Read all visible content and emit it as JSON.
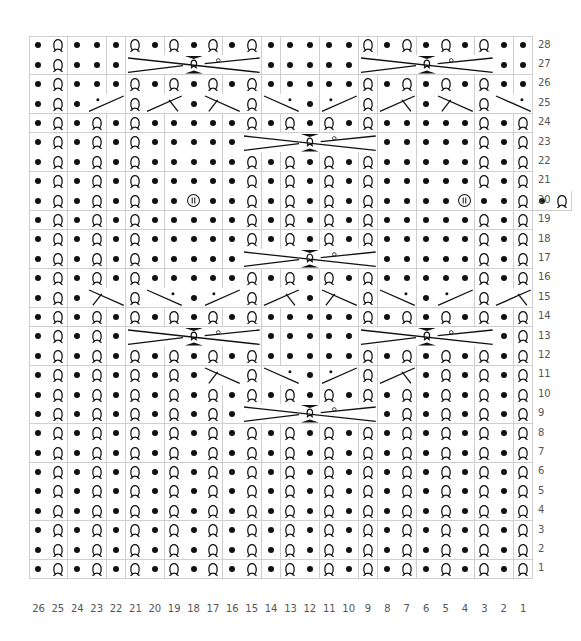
{
  "chart_data": {
    "type": "table",
    "title": "",
    "columns": 26,
    "rows": 28,
    "legend": {
      "P": "purl (dot)",
      "Q": "knit through back loop (twisted loop)",
      "B": "bobble / (II) symbol",
      "C7": "7-stitch cable cross",
      "XU": "2-stitch cross, rising right, with dot",
      "XUB": "2-stitch cross, rising right, with branch",
      "XD": "2-stitch cross, falling right, with dot",
      "XDB": "2-stitch cross, falling right, with branch"
    },
    "row_data": {
      "28": [
        "P",
        "Q",
        "P",
        "P",
        "P",
        "Q",
        "P",
        "Q",
        "P",
        "Q",
        "P",
        "Q",
        "P",
        "P",
        "P",
        "P",
        "P",
        "Q",
        "P",
        "Q",
        "P",
        "Q",
        "P",
        "Q",
        "P",
        "P"
      ],
      "27": [
        "P",
        "Q",
        "P",
        "P",
        "P",
        "C7:21-15",
        "P",
        "P",
        "P",
        "P",
        "P",
        "C7:9-3",
        "P",
        "P"
      ],
      "26": [
        "P",
        "Q",
        "P",
        "P",
        "P",
        "Q",
        "P",
        "Q",
        "P",
        "Q",
        "P",
        "Q",
        "P",
        "P",
        "P",
        "P",
        "P",
        "Q",
        "P",
        "Q",
        "P",
        "Q",
        "P",
        "Q",
        "P",
        "P"
      ],
      "25": [
        "P",
        "Q",
        "P",
        "XU",
        "Q",
        "XUB",
        "P",
        "XDB",
        "Q",
        "XD",
        "P",
        "XU",
        "Q",
        "XUB",
        "P",
        "XDB",
        "Q",
        "XD"
      ],
      "24": [
        "P",
        "Q",
        "P",
        "Q",
        "P",
        "Q",
        "P",
        "P",
        "P",
        "P",
        "P",
        "Q",
        "P",
        "Q",
        "P",
        "Q",
        "P",
        "Q",
        "P",
        "P",
        "P",
        "P",
        "P",
        "Q",
        "P",
        "Q"
      ],
      "23": [
        "P",
        "Q",
        "P",
        "Q",
        "P",
        "Q",
        "P",
        "P",
        "P",
        "P",
        "P",
        "C7:15-9",
        "P",
        "P",
        "P",
        "P",
        "P",
        "Q",
        "P",
        "Q"
      ],
      "22": [
        "P",
        "Q",
        "P",
        "Q",
        "P",
        "Q",
        "P",
        "P",
        "P",
        "P",
        "P",
        "Q",
        "P",
        "Q",
        "P",
        "Q",
        "P",
        "Q",
        "P",
        "P",
        "P",
        "P",
        "P",
        "Q",
        "P",
        "Q"
      ],
      "21": [
        "P",
        "Q",
        "P",
        "Q",
        "P",
        "Q",
        "P",
        "P",
        "P",
        "P",
        "P",
        "Q",
        "P",
        "Q",
        "P",
        "Q",
        "P",
        "Q",
        "P",
        "P",
        "P",
        "P",
        "P",
        "Q",
        "P",
        "Q"
      ],
      "20": [
        "P",
        "Q",
        "P",
        "Q",
        "P",
        "Q",
        "P",
        "P",
        "B",
        "P",
        "P",
        "Q",
        "P",
        "Q",
        "P",
        "Q",
        "P",
        "Q",
        "P",
        "P",
        "P",
        "P",
        "B",
        "P",
        "P",
        "Q",
        "P",
        "Q"
      ],
      "19": [
        "P",
        "Q",
        "P",
        "Q",
        "P",
        "Q",
        "P",
        "P",
        "P",
        "P",
        "P",
        "Q",
        "P",
        "Q",
        "P",
        "Q",
        "P",
        "Q",
        "P",
        "P",
        "P",
        "P",
        "P",
        "Q",
        "P",
        "Q"
      ],
      "18": [
        "P",
        "Q",
        "P",
        "Q",
        "P",
        "Q",
        "P",
        "P",
        "P",
        "P",
        "P",
        "Q",
        "P",
        "Q",
        "P",
        "Q",
        "P",
        "Q",
        "P",
        "P",
        "P",
        "P",
        "P",
        "Q",
        "P",
        "Q"
      ],
      "17": [
        "P",
        "Q",
        "P",
        "Q",
        "P",
        "Q",
        "P",
        "P",
        "P",
        "P",
        "P",
        "C7:15-9",
        "P",
        "P",
        "P",
        "P",
        "P",
        "Q",
        "P",
        "Q"
      ],
      "16": [
        "P",
        "Q",
        "P",
        "Q",
        "P",
        "Q",
        "P",
        "P",
        "P",
        "P",
        "P",
        "Q",
        "P",
        "Q",
        "P",
        "Q",
        "P",
        "Q",
        "P",
        "P",
        "P",
        "P",
        "P",
        "Q",
        "P",
        "Q"
      ],
      "15": [
        "P",
        "Q",
        "P",
        "XDB",
        "Q",
        "XD",
        "P",
        "XU",
        "Q",
        "XUB",
        "P",
        "XDB",
        "Q",
        "XD",
        "P",
        "XU",
        "Q",
        "XUB"
      ],
      "14": [
        "P",
        "Q",
        "P",
        "Q",
        "P",
        "Q",
        "P",
        "Q",
        "P",
        "Q",
        "P",
        "Q",
        "P",
        "P",
        "P",
        "P",
        "P",
        "Q",
        "P",
        "Q",
        "P",
        "Q",
        "P",
        "Q",
        "P",
        "Q"
      ],
      "13": [
        "P",
        "Q",
        "P",
        "Q",
        "P",
        "C7:21-15",
        "P",
        "P",
        "P",
        "P",
        "P",
        "C7:9-3",
        "P",
        "Q"
      ],
      "12": [
        "P",
        "Q",
        "P",
        "Q",
        "P",
        "Q",
        "P",
        "Q",
        "P",
        "Q",
        "P",
        "Q",
        "P",
        "P",
        "P",
        "P",
        "P",
        "Q",
        "P",
        "Q",
        "P",
        "Q",
        "P",
        "Q",
        "P",
        "Q"
      ],
      "11": [
        "P",
        "Q",
        "P",
        "Q",
        "P",
        "Q",
        "P",
        "Q",
        "P",
        "XDB",
        "Q",
        "XD",
        "P",
        "XU",
        "Q",
        "XUB",
        "P",
        "Q",
        "P",
        "Q",
        "P",
        "Q"
      ],
      "10": [
        "P",
        "Q",
        "P",
        "Q",
        "P",
        "Q",
        "P",
        "Q",
        "P",
        "Q",
        "P",
        "Q",
        "P",
        "Q",
        "P",
        "Q",
        "P",
        "Q",
        "P",
        "Q",
        "P",
        "Q",
        "P",
        "Q",
        "P",
        "Q"
      ],
      "9": [
        "P",
        "Q",
        "P",
        "Q",
        "P",
        "Q",
        "P",
        "Q",
        "P",
        "Q",
        "P",
        "C7:15-9",
        "P",
        "Q",
        "P",
        "Q",
        "P",
        "Q",
        "P",
        "Q"
      ],
      "8": [
        "P",
        "Q",
        "P",
        "Q",
        "P",
        "Q",
        "P",
        "Q",
        "P",
        "Q",
        "P",
        "Q",
        "P",
        "Q",
        "P",
        "Q",
        "P",
        "Q",
        "P",
        "Q",
        "P",
        "Q",
        "P",
        "Q",
        "P",
        "Q"
      ],
      "7": [
        "P",
        "Q",
        "P",
        "Q",
        "P",
        "Q",
        "P",
        "Q",
        "P",
        "Q",
        "P",
        "Q",
        "P",
        "Q",
        "P",
        "Q",
        "P",
        "Q",
        "P",
        "Q",
        "P",
        "Q",
        "P",
        "Q",
        "P",
        "Q"
      ],
      "6": [
        "P",
        "Q",
        "P",
        "Q",
        "P",
        "Q",
        "P",
        "Q",
        "P",
        "Q",
        "P",
        "Q",
        "P",
        "Q",
        "P",
        "Q",
        "P",
        "Q",
        "P",
        "Q",
        "P",
        "Q",
        "P",
        "Q",
        "P",
        "Q"
      ],
      "5": [
        "P",
        "Q",
        "P",
        "Q",
        "P",
        "Q",
        "P",
        "Q",
        "P",
        "Q",
        "P",
        "Q",
        "P",
        "Q",
        "P",
        "Q",
        "P",
        "Q",
        "P",
        "Q",
        "P",
        "Q",
        "P",
        "Q",
        "P",
        "Q"
      ],
      "4": [
        "P",
        "Q",
        "P",
        "Q",
        "P",
        "Q",
        "P",
        "Q",
        "P",
        "Q",
        "P",
        "Q",
        "P",
        "Q",
        "P",
        "Q",
        "P",
        "Q",
        "P",
        "Q",
        "P",
        "Q",
        "P",
        "Q",
        "P",
        "Q"
      ],
      "3": [
        "P",
        "Q",
        "P",
        "Q",
        "P",
        "Q",
        "P",
        "Q",
        "P",
        "Q",
        "P",
        "Q",
        "P",
        "Q",
        "P",
        "Q",
        "P",
        "Q",
        "P",
        "Q",
        "P",
        "Q",
        "P",
        "Q",
        "P",
        "Q"
      ],
      "2": [
        "P",
        "Q",
        "P",
        "Q",
        "P",
        "Q",
        "P",
        "Q",
        "P",
        "Q",
        "P",
        "Q",
        "P",
        "Q",
        "P",
        "Q",
        "P",
        "Q",
        "P",
        "Q",
        "P",
        "Q",
        "P",
        "Q",
        "P",
        "Q"
      ],
      "1": [
        "P",
        "Q",
        "P",
        "Q",
        "P",
        "Q",
        "P",
        "Q",
        "P",
        "Q",
        "P",
        "Q",
        "P",
        "Q",
        "P",
        "Q",
        "P",
        "Q",
        "P",
        "Q",
        "P",
        "Q",
        "P",
        "Q",
        "P",
        "Q"
      ]
    },
    "row_labels": [
      "28",
      "27",
      "26",
      "25",
      "24",
      "23",
      "22",
      "21",
      "20",
      "19",
      "18",
      "17",
      "16",
      "15",
      "14",
      "13",
      "12",
      "11",
      "10",
      "9",
      "8",
      "7",
      "6",
      "5",
      "4",
      "3",
      "2",
      "1"
    ],
    "column_labels": [
      "26",
      "25",
      "24",
      "23",
      "22",
      "21",
      "20",
      "19",
      "18",
      "17",
      "16",
      "15",
      "14",
      "13",
      "12",
      "11",
      "10",
      "9",
      "8",
      "7",
      "6",
      "5",
      "4",
      "3",
      "2",
      "1"
    ]
  },
  "style": {
    "grid_line_color": "#cfcfcf",
    "symbol_color": "#111111",
    "label_color": "#555555"
  }
}
